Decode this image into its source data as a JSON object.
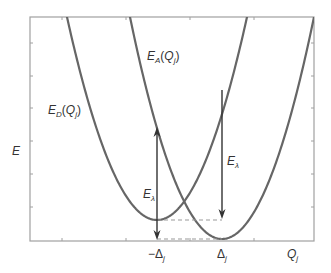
{
  "figure": {
    "type": "potential-energy-parabolas",
    "y_axis_label": "E",
    "x_axis_label": {
      "main": "Q",
      "sub": "j"
    },
    "curves": [
      {
        "name": "donor",
        "label": {
          "main": "E",
          "sub": "D",
          "arg_main": "Q",
          "arg_sub": "j"
        },
        "minimum_x_label": "-Δj",
        "color": "#666666"
      },
      {
        "name": "acceptor",
        "label": {
          "main": "E",
          "sub": "A",
          "arg_main": "Q",
          "arg_sub": "j"
        },
        "minimum_x_label": "Δj",
        "color": "#666666"
      }
    ],
    "arrows": [
      {
        "name": "reorganization-energy-left",
        "label": {
          "main": "E",
          "sub": "λ"
        }
      },
      {
        "name": "reorganization-energy-right",
        "label": {
          "main": "E",
          "sub": "λ"
        }
      }
    ],
    "tick_labels": {
      "neg_delta": {
        "sign": "−",
        "main": "Δ",
        "sub": "j"
      },
      "pos_delta": {
        "main": "Δ",
        "sub": "j"
      }
    },
    "colors": {
      "curve": "#666666",
      "axis": "#999999",
      "arrow": "#333333",
      "dash": "#999999",
      "text": "#333333"
    }
  }
}
